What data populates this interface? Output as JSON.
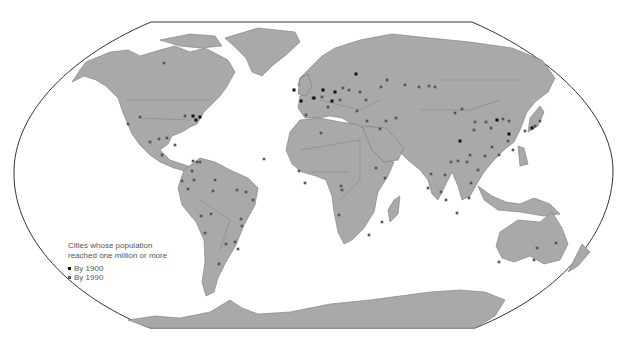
{
  "legend": {
    "title_line1": "Cities whose population",
    "title_line2": "reached one million or more",
    "items": [
      {
        "label": "By 1900",
        "color": "#111111"
      },
      {
        "label": "By 1990",
        "color": "#555555"
      }
    ]
  },
  "colors": {
    "land": "#a9a9a9",
    "water": "#ffffff",
    "frame": "#333333"
  },
  "cities_1900": [
    [
      294,
      90
    ],
    [
      301,
      101
    ],
    [
      323,
      90
    ],
    [
      356,
      74
    ],
    [
      332,
      101
    ],
    [
      335,
      92
    ],
    [
      314,
      98
    ],
    [
      193,
      116
    ],
    [
      200,
      117
    ],
    [
      196,
      120
    ],
    [
      497,
      120
    ],
    [
      532,
      128
    ],
    [
      460,
      141
    ],
    [
      509,
      134
    ]
  ],
  "cities_1990": [
    [
      164,
      63
    ],
    [
      185,
      116
    ],
    [
      140,
      117
    ],
    [
      128,
      124
    ],
    [
      159,
      139
    ],
    [
      167,
      138
    ],
    [
      150,
      142
    ],
    [
      175,
      145
    ],
    [
      162,
      155
    ],
    [
      193,
      161
    ],
    [
      197,
      162
    ],
    [
      200,
      162
    ],
    [
      192,
      171
    ],
    [
      194,
      180
    ],
    [
      182,
      181
    ],
    [
      215,
      180
    ],
    [
      213,
      191
    ],
    [
      237,
      190
    ],
    [
      246,
      192
    ],
    [
      253,
      200
    ],
    [
      241,
      219
    ],
    [
      242,
      226
    ],
    [
      235,
      242
    ],
    [
      238,
      249
    ],
    [
      226,
      244
    ],
    [
      219,
      264
    ],
    [
      205,
      233
    ],
    [
      211,
      214
    ],
    [
      188,
      189
    ],
    [
      201,
      216
    ],
    [
      306,
      115
    ],
    [
      313,
      98
    ],
    [
      322,
      97
    ],
    [
      328,
      107
    ],
    [
      340,
      100
    ],
    [
      343,
      88
    ],
    [
      349,
      90
    ],
    [
      360,
      92
    ],
    [
      366,
      100
    ],
    [
      357,
      111
    ],
    [
      367,
      121
    ],
    [
      386,
      121
    ],
    [
      396,
      118
    ],
    [
      380,
      129
    ],
    [
      381,
      87
    ],
    [
      387,
      80
    ],
    [
      405,
      85
    ],
    [
      419,
      87
    ],
    [
      429,
      86
    ],
    [
      435,
      87
    ],
    [
      455,
      113
    ],
    [
      462,
      109
    ],
    [
      475,
      122
    ],
    [
      474,
      130
    ],
    [
      486,
      122
    ],
    [
      491,
      128
    ],
    [
      503,
      119
    ],
    [
      509,
      121
    ],
    [
      508,
      141
    ],
    [
      513,
      150
    ],
    [
      499,
      155
    ],
    [
      485,
      156
    ],
    [
      470,
      155
    ],
    [
      467,
      162
    ],
    [
      451,
      162
    ],
    [
      445,
      175
    ],
    [
      441,
      192
    ],
    [
      458,
      161
    ],
    [
      431,
      174
    ],
    [
      428,
      188
    ],
    [
      446,
      200
    ],
    [
      457,
      213
    ],
    [
      469,
      198
    ],
    [
      471,
      183
    ],
    [
      478,
      170
    ],
    [
      492,
      147
    ],
    [
      525,
      131
    ],
    [
      535,
      126
    ],
    [
      540,
      121
    ],
    [
      376,
      168
    ],
    [
      385,
      178
    ],
    [
      341,
      186
    ],
    [
      342,
      190
    ],
    [
      339,
      215
    ],
    [
      369,
      235
    ],
    [
      382,
      222
    ],
    [
      499,
      262
    ],
    [
      537,
      248
    ],
    [
      556,
      243
    ],
    [
      534,
      260
    ],
    [
      299,
      171
    ],
    [
      305,
      183
    ],
    [
      264,
      159
    ],
    [
      321,
      133
    ]
  ]
}
